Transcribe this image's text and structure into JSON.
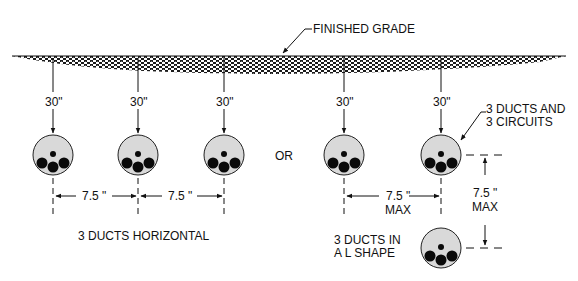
{
  "labels": {
    "finished_grade": "FINISHED GRADE",
    "depth": "30\"",
    "or": "OR",
    "circuits_line1": "3 DUCTS AND",
    "circuits_line2": "3 CIRCUITS",
    "spacing": "7.5 \"",
    "max": "MAX",
    "horizontal": "3 DUCTS HORIZONTAL",
    "lshape_line1": "3 DUCTS IN",
    "lshape_line2": "A L SHAPE"
  },
  "colors": {
    "ink": "#111111",
    "duct_fill": "#d9d9d9",
    "conductor": "#0a0a0a"
  },
  "ducts": [
    {
      "id": "h1",
      "x": 53,
      "y": 155
    },
    {
      "id": "h2",
      "x": 138,
      "y": 155
    },
    {
      "id": "h3",
      "x": 224,
      "y": 155
    },
    {
      "id": "l1",
      "x": 344,
      "y": 155
    },
    {
      "id": "l2",
      "x": 441,
      "y": 155
    },
    {
      "id": "l3",
      "x": 441,
      "y": 248
    }
  ]
}
